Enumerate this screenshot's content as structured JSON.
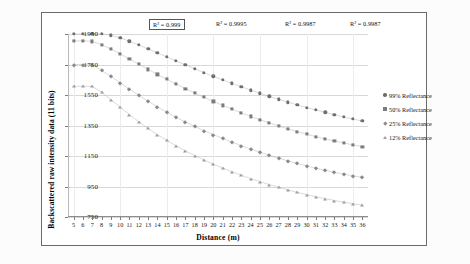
{
  "chart_data": {
    "type": "scatter",
    "title": "",
    "xlabel": "Distance (m)",
    "ylabel": "Backscattered  raw intensity data (11 bits)",
    "xlim": [
      4.4,
      36.6
    ],
    "ylim": [
      750,
      1950
    ],
    "yticks": [
      750,
      950,
      1150,
      1350,
      1550,
      1750,
      1950
    ],
    "xticks": [
      5,
      6,
      7,
      8,
      9,
      10,
      11,
      12,
      13,
      14,
      15,
      16,
      17,
      18,
      19,
      20,
      21,
      22,
      23,
      24,
      25,
      26,
      27,
      28,
      29,
      30,
      31,
      32,
      33,
      34,
      35,
      36
    ],
    "grid": "horizontal",
    "legend_position": "right",
    "x": [
      5,
      6,
      7,
      8,
      9,
      10,
      11,
      12,
      13,
      14,
      15,
      16,
      17,
      18,
      19,
      20,
      21,
      22,
      23,
      24,
      25,
      26,
      27,
      28,
      29,
      30,
      31,
      32,
      33,
      34,
      35,
      36
    ],
    "series": [
      {
        "name": "99% Reflectance",
        "marker": "circle",
        "color": "#6f6f6f",
        "r_squared_label": "R² = 0.999",
        "values": [
          1950,
          1950,
          1950,
          1950,
          1942,
          1925,
          1902,
          1878,
          1852,
          1826,
          1800,
          1774,
          1748,
          1722,
          1697,
          1673,
          1649,
          1626,
          1604,
          1582,
          1561,
          1541,
          1522,
          1503,
          1485,
          1468,
          1452,
          1436,
          1421,
          1406,
          1392,
          1379
        ]
      },
      {
        "name": "50% Reflectance",
        "marker": "square",
        "color": "#7c7c7c",
        "r_squared_label": "R² = 0.9995",
        "values": [
          1905,
          1905,
          1902,
          1880,
          1852,
          1820,
          1786,
          1752,
          1718,
          1685,
          1653,
          1622,
          1592,
          1563,
          1535,
          1508,
          1482,
          1457,
          1433,
          1410,
          1388,
          1367,
          1347,
          1328,
          1310,
          1293,
          1277,
          1262,
          1248,
          1235,
          1223,
          1212
        ]
      },
      {
        "name": "25% Reflectance",
        "marker": "diamond",
        "color": "#8a8a8a",
        "r_squared_label": "R² = 0.9987",
        "values": [
          1750,
          1750,
          1748,
          1712,
          1672,
          1630,
          1588,
          1548,
          1509,
          1472,
          1437,
          1404,
          1373,
          1344,
          1316,
          1290,
          1265,
          1241,
          1218,
          1196,
          1175,
          1155,
          1136,
          1118,
          1101,
          1085,
          1070,
          1056,
          1043,
          1031,
          1020,
          1010
        ]
      },
      {
        "name": "12% Reflectance",
        "marker": "triangle",
        "color": "#a0a0a0",
        "r_squared_label": "R² = 0.9987",
        "values": [
          1608,
          1608,
          1606,
          1568,
          1520,
          1470,
          1421,
          1375,
          1331,
          1290,
          1252,
          1217,
          1184,
          1153,
          1124,
          1097,
          1071,
          1047,
          1024,
          1002,
          982,
          963,
          945,
          928,
          912,
          897,
          883,
          870,
          858,
          847,
          837,
          828
        ]
      }
    ],
    "annotations": [
      {
        "text": "R² = 0.999",
        "boxed": true,
        "x_px": 149,
        "y_px": 19
      },
      {
        "text": "R² = 0.9995",
        "boxed": false,
        "x_px": 213,
        "y_px": 19
      },
      {
        "text": "R² = 0.9987",
        "boxed": false,
        "x_px": 282,
        "y_px": 19
      },
      {
        "text": "R² = 0.9987",
        "boxed": false,
        "x_px": 347,
        "y_px": 19
      }
    ]
  }
}
